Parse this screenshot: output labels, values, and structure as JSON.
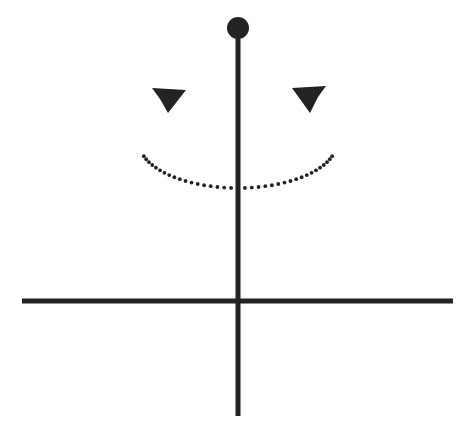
{
  "figure": {
    "canvas": {
      "width": 466,
      "height": 432,
      "background": "#ffffff"
    },
    "ink_color": "#232323"
  },
  "chart_data": {
    "type": "diagram",
    "elements": [
      {
        "name": "bob",
        "shape": "filled-circle",
        "center_x": 238,
        "center_y": 28,
        "radius": 11,
        "color": "#232323"
      },
      {
        "name": "vertical-rod",
        "shape": "line",
        "x1": 238,
        "y1": 28,
        "x2": 238,
        "y2": 416,
        "thickness": 5,
        "color": "#232323"
      },
      {
        "name": "horizontal-axis-line",
        "shape": "line",
        "x1": 22,
        "y1": 301,
        "x2": 453,
        "y2": 301,
        "thickness": 5,
        "color": "#232323"
      },
      {
        "name": "rotation-arc",
        "shape": "dotted-elliptical-arc",
        "center_x": 238,
        "center_y": 142,
        "radius_x": 99,
        "radius_y": 46,
        "start_angle_deg": 18,
        "end_angle_deg": 162,
        "dot_radius": 1.9,
        "dot_count": 37,
        "color": "#232323"
      },
      {
        "name": "arrowhead-left",
        "shape": "filled-triangle",
        "tip_x": 186,
        "tip_y": 90,
        "direction": "up-right",
        "color": "#232323"
      },
      {
        "name": "arrowhead-right",
        "shape": "filled-triangle",
        "tip_x": 292,
        "tip_y": 88,
        "direction": "up-left",
        "color": "#232323"
      }
    ],
    "xlabel": "",
    "ylabel": "",
    "grid": false,
    "legend": "none",
    "annotations": []
  }
}
